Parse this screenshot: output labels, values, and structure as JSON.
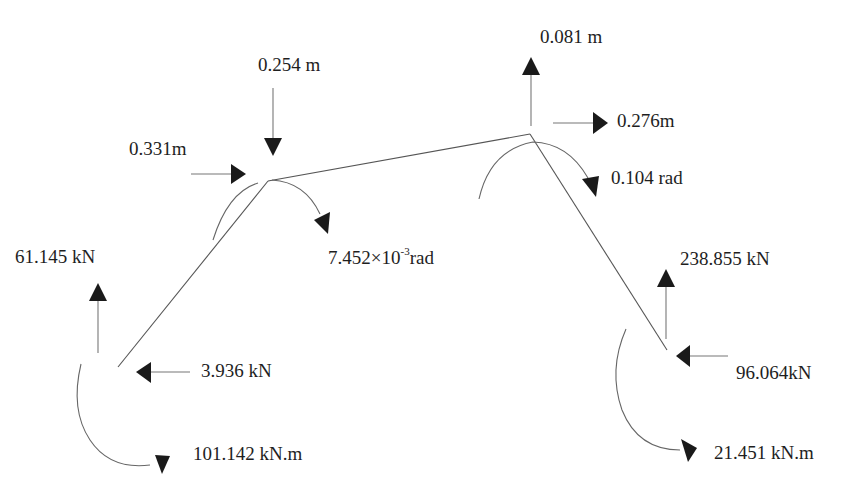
{
  "diagram": {
    "type": "portal frame free-body diagram",
    "nodes": {
      "left_support": {
        "x": 118,
        "y": 367
      },
      "left_knee": {
        "x": 268,
        "y": 181
      },
      "apex": {
        "x": 530,
        "y": 134
      },
      "right_support": {
        "x": 667,
        "y": 350
      }
    },
    "members": [
      {
        "from": "left_support",
        "to": "left_knee"
      },
      {
        "from": "left_knee",
        "to": "apex"
      },
      {
        "from": "apex",
        "to": "right_support"
      }
    ]
  },
  "labels": {
    "knee_vertical_disp": "0.254 m",
    "knee_horizontal_disp": "0.331m",
    "knee_rotation_value": "7.452×10",
    "knee_rotation_exp": "-3",
    "knee_rotation_unit": "rad",
    "apex_vertical_disp": "0.081 m",
    "apex_horizontal_disp": "0.276m",
    "apex_rotation": "0.104 rad",
    "left_vertical_reaction": "61.145 kN",
    "left_horizontal_reaction": "3.936 kN",
    "left_moment_reaction": "101.142 kN.m",
    "right_vertical_reaction": "238.855 kN",
    "right_horizontal_reaction": "96.064kN",
    "right_moment_reaction": "21.451 kN.m"
  },
  "quantities": [
    {
      "location": "left knee",
      "kind": "vertical displacement",
      "direction": "down",
      "value": 0.254,
      "unit": "m"
    },
    {
      "location": "left knee",
      "kind": "horizontal displacement",
      "direction": "right",
      "value": 0.331,
      "unit": "m"
    },
    {
      "location": "left knee",
      "kind": "rotation",
      "direction": "clockwise",
      "value": 0.007452,
      "unit": "rad"
    },
    {
      "location": "apex",
      "kind": "vertical displacement",
      "direction": "up",
      "value": 0.081,
      "unit": "m"
    },
    {
      "location": "apex",
      "kind": "horizontal displacement",
      "direction": "right",
      "value": 0.276,
      "unit": "m"
    },
    {
      "location": "apex",
      "kind": "rotation",
      "direction": "clockwise",
      "value": 0.104,
      "unit": "rad"
    },
    {
      "location": "left support",
      "kind": "vertical reaction",
      "direction": "up",
      "value": 61.145,
      "unit": "kN"
    },
    {
      "location": "left support",
      "kind": "horizontal reaction",
      "direction": "left",
      "value": 3.936,
      "unit": "kN"
    },
    {
      "location": "left support",
      "kind": "moment reaction",
      "direction": "counterclockwise",
      "value": 101.142,
      "unit": "kN.m"
    },
    {
      "location": "right support",
      "kind": "vertical reaction",
      "direction": "up",
      "value": 238.855,
      "unit": "kN"
    },
    {
      "location": "right support",
      "kind": "horizontal reaction",
      "direction": "left",
      "value": 96.064,
      "unit": "kN"
    },
    {
      "location": "right support",
      "kind": "moment reaction",
      "direction": "counterclockwise",
      "value": 21.451,
      "unit": "kN.m"
    }
  ]
}
